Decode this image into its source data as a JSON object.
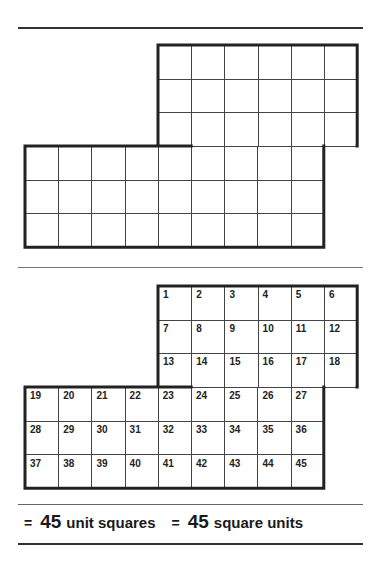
{
  "figure_1": {
    "description": "Unlabeled grid of unit squares",
    "top_block": {
      "cols": 6,
      "rows": 3
    },
    "bottom_block": {
      "cols": 9,
      "rows": 3
    }
  },
  "figure_2": {
    "numbers": [
      "1",
      "2",
      "3",
      "4",
      "5",
      "6",
      "7",
      "8",
      "9",
      "10",
      "11",
      "12",
      "13",
      "14",
      "15",
      "16",
      "17",
      "18",
      "19",
      "20",
      "21",
      "22",
      "23",
      "24",
      "25",
      "26",
      "27",
      "28",
      "29",
      "30",
      "31",
      "32",
      "33",
      "34",
      "35",
      "36",
      "37",
      "38",
      "39",
      "40",
      "41",
      "42",
      "43",
      "44",
      "45"
    ]
  },
  "result": {
    "eq1_symbol": "=",
    "eq1_value": "45",
    "eq1_label": "unit squares",
    "eq2_symbol": "=",
    "eq2_value": "45",
    "eq2_label": "square units"
  }
}
